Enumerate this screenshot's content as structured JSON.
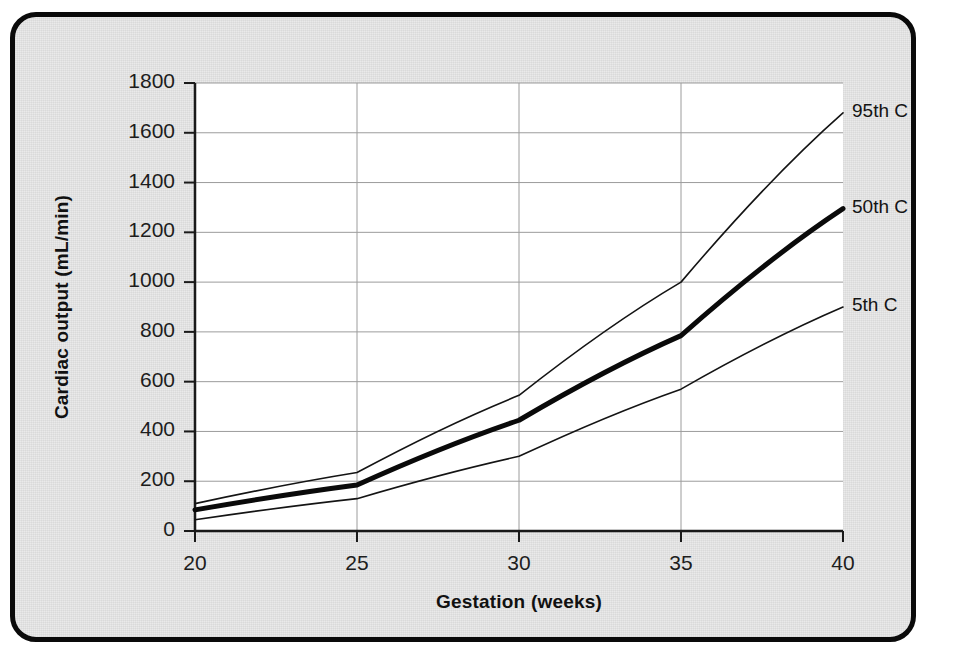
{
  "figure": {
    "background_color": "#e9e9e9",
    "plot_background_color": "#ffffff",
    "border_color": "#0a0a0a"
  },
  "chart_data": {
    "type": "line",
    "title": "",
    "xlabel": "Gestation (weeks)",
    "ylabel": "Cardiac output (mL/min)",
    "x": [
      20,
      25,
      30,
      35,
      40
    ],
    "xtick_labels": [
      "20",
      "25",
      "30",
      "35",
      "40"
    ],
    "ytick_labels": [
      "0",
      "200",
      "400",
      "600",
      "800",
      "1000",
      "1200",
      "1400",
      "1600",
      "1800"
    ],
    "yticks": [
      0,
      200,
      400,
      600,
      800,
      1000,
      1200,
      1400,
      1600,
      1800
    ],
    "xlim": [
      20,
      40
    ],
    "ylim": [
      0,
      1800
    ],
    "grid": "horizontal-and-vertical",
    "legend_position": "right-of-line-ends",
    "series": [
      {
        "name": "95th C",
        "label": "95th C",
        "values": [
          110,
          235,
          545,
          1000,
          1680
        ],
        "color": "#141414",
        "line_width": 1.6
      },
      {
        "name": "50th C",
        "label": "50th C",
        "values": [
          85,
          185,
          445,
          785,
          1295
        ],
        "color": "#0a0a0a",
        "line_width": 5
      },
      {
        "name": "5th C",
        "label": "5th C",
        "values": [
          45,
          130,
          300,
          570,
          900
        ],
        "color": "#141414",
        "line_width": 1.6
      }
    ]
  }
}
